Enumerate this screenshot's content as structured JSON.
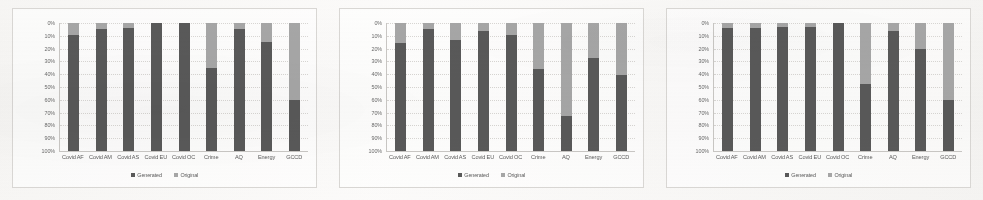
{
  "figure": {
    "panel_count": 3,
    "colors": {
      "generated": "#595959",
      "original": "#a6a6a6",
      "axis": "#c9c7c4",
      "grid": "#d8d6d3",
      "text": "#5a5a5a",
      "background": "#f7f6f4"
    }
  },
  "axis": {
    "y_ticks": [
      "100%",
      "90%",
      "80%",
      "70%",
      "60%",
      "50%",
      "40%",
      "30%",
      "20%",
      "10%",
      "0%"
    ],
    "ylim": [
      0,
      100
    ]
  },
  "legend": {
    "items": [
      {
        "label": "Generated",
        "color": "#595959",
        "swatch": "square-swatch"
      },
      {
        "label": "Original",
        "color": "#a6a6a6",
        "swatch": "square-swatch"
      }
    ]
  },
  "categories": [
    "Covid AF",
    "Covid AM",
    "Covid AS",
    "Covid EU",
    "Covid OC",
    "Crime",
    "AQ",
    "Energy",
    "GCCD"
  ],
  "chart_data": [
    {
      "type": "bar",
      "title": "",
      "subtitle": "",
      "stacked": true,
      "stack_normalized": true,
      "xlabel": "",
      "ylabel": "",
      "ylim": [
        0,
        100
      ],
      "yticks": [
        0,
        10,
        20,
        30,
        40,
        50,
        60,
        70,
        80,
        90,
        100
      ],
      "ytick_labels": [
        "0%",
        "10%",
        "20%",
        "30%",
        "40%",
        "50%",
        "60%",
        "70%",
        "80%",
        "90%",
        "100%"
      ],
      "grid": true,
      "legend_position": "bottom-center",
      "categories": [
        "Covid AF",
        "Covid AM",
        "Covid AS",
        "Covid EU",
        "Covid OC",
        "Crime",
        "AQ",
        "Energy",
        "GCCD"
      ],
      "series": [
        {
          "name": "Generated",
          "color": "#595959",
          "values": [
            91,
            95,
            96,
            100,
            100,
            65,
            95,
            85,
            40
          ]
        },
        {
          "name": "Original",
          "color": "#a6a6a6",
          "values": [
            9,
            5,
            4,
            0,
            0,
            35,
            5,
            15,
            60
          ]
        }
      ]
    },
    {
      "type": "bar",
      "title": "",
      "subtitle": "",
      "stacked": true,
      "stack_normalized": true,
      "xlabel": "",
      "ylabel": "",
      "ylim": [
        0,
        100
      ],
      "yticks": [
        0,
        10,
        20,
        30,
        40,
        50,
        60,
        70,
        80,
        90,
        100
      ],
      "ytick_labels": [
        "0%",
        "10%",
        "20%",
        "30%",
        "40%",
        "50%",
        "60%",
        "70%",
        "80%",
        "90%",
        "100%"
      ],
      "grid": true,
      "legend_position": "bottom-center",
      "categories": [
        "Covid AF",
        "Covid AM",
        "Covid AS",
        "Covid EU",
        "Covid OC",
        "Crime",
        "AQ",
        "Energy",
        "GCCD"
      ],
      "series": [
        {
          "name": "Generated",
          "color": "#595959",
          "values": [
            84,
            95,
            87,
            94,
            91,
            64,
            27,
            73,
            59
          ]
        },
        {
          "name": "Original",
          "color": "#a6a6a6",
          "values": [
            16,
            5,
            13,
            6,
            9,
            36,
            73,
            27,
            41
          ]
        }
      ]
    },
    {
      "type": "bar",
      "title": "",
      "subtitle": "",
      "stacked": true,
      "stack_normalized": true,
      "xlabel": "",
      "ylabel": "",
      "ylim": [
        0,
        100
      ],
      "yticks": [
        0,
        10,
        20,
        30,
        40,
        50,
        60,
        70,
        80,
        90,
        100
      ],
      "ytick_labels": [
        "0%",
        "10%",
        "20%",
        "30%",
        "40%",
        "50%",
        "60%",
        "70%",
        "80%",
        "90%",
        "100%"
      ],
      "grid": true,
      "legend_position": "bottom-center",
      "categories": [
        "Covid AF",
        "Covid AM",
        "Covid AS",
        "Covid EU",
        "Covid OC",
        "Crime",
        "AQ",
        "Energy",
        "GCCD"
      ],
      "series": [
        {
          "name": "Generated",
          "color": "#595959",
          "values": [
            96,
            96,
            97,
            97,
            100,
            52,
            94,
            80,
            40
          ]
        },
        {
          "name": "Original",
          "color": "#a6a6a6",
          "values": [
            4,
            4,
            3,
            3,
            0,
            48,
            6,
            20,
            60
          ]
        }
      ]
    }
  ]
}
